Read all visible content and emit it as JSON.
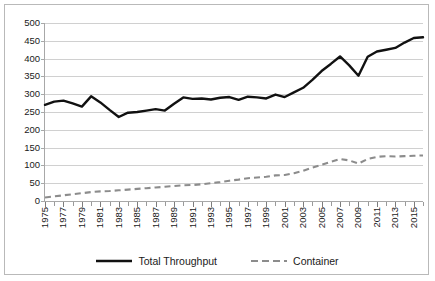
{
  "chart_data": {
    "type": "line",
    "title": "",
    "xlabel": "",
    "ylabel": "",
    "ylim": [
      0,
      500
    ],
    "ytick_step": 50,
    "y_ticks": [
      "0",
      "50",
      "100",
      "150",
      "200",
      "250",
      "300",
      "350",
      "400",
      "450",
      "500"
    ],
    "grid": true,
    "legend_position": "bottom",
    "x": [
      1975,
      1976,
      1977,
      1978,
      1979,
      1980,
      1981,
      1982,
      1983,
      1984,
      1985,
      1986,
      1987,
      1988,
      1989,
      1990,
      1991,
      1992,
      1993,
      1994,
      1995,
      1996,
      1997,
      1998,
      1999,
      2000,
      2001,
      2002,
      2003,
      2004,
      2005,
      2006,
      2007,
      2008,
      2009,
      2010,
      2011,
      2012,
      2013,
      2014,
      2015,
      2016
    ],
    "x_tick_labels": [
      "1975",
      "1977",
      "1979",
      "1981",
      "1983",
      "1985",
      "1987",
      "1989",
      "1991",
      "1993",
      "1995",
      "1997",
      "1999",
      "2001",
      "2003",
      "2005",
      "2007",
      "2009",
      "2011",
      "2013",
      "2015"
    ],
    "series": [
      {
        "name": "Total Throughput",
        "style": "solid",
        "color": "#111111",
        "values": [
          270,
          279,
          282,
          274,
          265,
          294,
          277,
          256,
          236,
          248,
          250,
          254,
          258,
          254,
          273,
          291,
          287,
          288,
          285,
          290,
          292,
          284,
          293,
          291,
          288,
          299,
          292,
          305,
          318,
          340,
          365,
          385,
          406,
          381,
          352,
          405,
          420,
          425,
          430,
          445,
          458,
          460
        ]
      },
      {
        "name": "Container",
        "style": "dashed",
        "color": "#8c8c8c",
        "values": [
          10,
          13,
          16,
          19,
          22,
          25,
          27,
          28,
          30,
          32,
          34,
          36,
          38,
          40,
          42,
          44,
          45,
          47,
          50,
          53,
          57,
          60,
          64,
          66,
          68,
          72,
          73,
          78,
          85,
          94,
          102,
          110,
          118,
          114,
          105,
          118,
          124,
          126,
          125,
          126,
          127,
          128
        ]
      }
    ]
  },
  "legend": {
    "items": [
      {
        "label": "Total Throughput"
      },
      {
        "label": "Container"
      }
    ]
  }
}
